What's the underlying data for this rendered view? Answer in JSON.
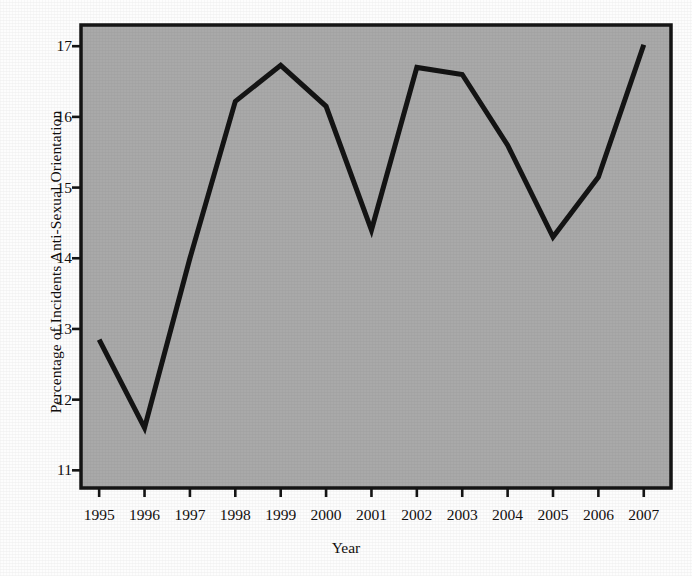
{
  "chart_data": {
    "type": "line",
    "title": "",
    "xlabel": "Year",
    "ylabel": "Percentage of Incidents Anti-Sexual Orientation",
    "x": [
      1995,
      1996,
      1997,
      1998,
      1999,
      2000,
      2001,
      2002,
      2003,
      2004,
      2005,
      2006,
      2007
    ],
    "categories": [
      "1995",
      "1996",
      "1997",
      "1998",
      "1999",
      "2000",
      "2001",
      "2002",
      "2003",
      "2004",
      "2005",
      "2006",
      "2007"
    ],
    "values": [
      12.85,
      11.6,
      14.0,
      16.22,
      16.73,
      16.15,
      14.4,
      16.7,
      16.6,
      15.6,
      14.3,
      15.15,
      17.02
    ],
    "series": [
      {
        "name": "Percentage of Incidents Anti-Sexual Orientation",
        "values": [
          12.85,
          11.6,
          14.0,
          16.22,
          16.73,
          16.15,
          14.4,
          16.7,
          16.6,
          15.6,
          14.3,
          15.15,
          17.02
        ]
      }
    ],
    "yticks": [
      11,
      12,
      13,
      14,
      15,
      16,
      17
    ],
    "ytick_labels": [
      "11",
      "12",
      "13",
      "14",
      "15",
      "16",
      "17"
    ],
    "xtick_labels": [
      "1995",
      "1996",
      "1997",
      "1998",
      "1999",
      "2000",
      "2001",
      "2002",
      "2003",
      "2004",
      "2005",
      "2006",
      "2007"
    ],
    "xlim": [
      1994.6,
      2007.6
    ],
    "ylim": [
      10.75,
      17.3
    ],
    "grid": false,
    "legend": "none",
    "line_color": "#141414",
    "line_width_px": 5,
    "plot_background_color": "#a9a9a9",
    "frame_color": "#151515",
    "page_background_color": "#fdfdfd"
  },
  "axis": {
    "y_title": "Percentage of Incidents Anti-Sexual Orientation",
    "x_title": "Year"
  }
}
